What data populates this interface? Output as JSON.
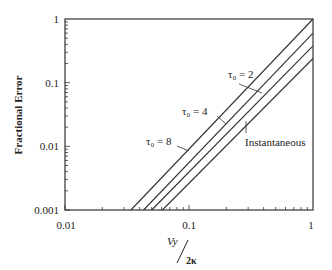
{
  "chart_data": {
    "type": "line",
    "title": "",
    "xlabel": "Vy / 2κ",
    "xlabel_parts": {
      "numerator": "Vy",
      "denominator": "2κ"
    },
    "ylabel": "Fractional Error",
    "xscale": "log",
    "yscale": "log",
    "xlim": [
      0.01,
      1
    ],
    "ylim": [
      0.001,
      1
    ],
    "grid": false,
    "legend": "inline annotations with leader lines",
    "x_ticks": [
      {
        "value": 0.01,
        "label": "0.01"
      },
      {
        "value": 0.1,
        "label": "0.1"
      },
      {
        "value": 1,
        "label": "1"
      }
    ],
    "y_ticks": [
      {
        "value": 1,
        "label": "1"
      },
      {
        "value": 0.1,
        "label": "0.1"
      },
      {
        "value": 0.01,
        "label": "0.01"
      },
      {
        "value": 0.001,
        "label": "0.001"
      }
    ],
    "series": [
      {
        "name": "τ0 = 8",
        "label": "τ₀ = 8",
        "points": [
          [
            0.034,
            0.001
          ],
          [
            1,
            1.0
          ]
        ]
      },
      {
        "name": "τ0 = 4",
        "label": "τ₀ = 4",
        "points": [
          [
            0.043,
            0.001
          ],
          [
            1,
            0.6
          ]
        ]
      },
      {
        "name": "τ0 = 2",
        "label": "τ₀ = 2",
        "points": [
          [
            0.05,
            0.001
          ],
          [
            1,
            0.38
          ]
        ]
      },
      {
        "name": "Instantaneous",
        "label": "Instantaneous",
        "points": [
          [
            0.061,
            0.001
          ],
          [
            1,
            0.24
          ]
        ]
      }
    ]
  },
  "annotations": {
    "tau2": "τ₀ = 2",
    "tau4": "τ₀ = 4",
    "tau8": "τ₀ = 8",
    "instantaneous": "Instantaneous"
  },
  "axes": {
    "ylabel": "Fractional Error",
    "xlabel_num": "Vy",
    "xlabel_den": "2κ",
    "x_tick_labels": [
      "0.01",
      "0.1",
      "1"
    ],
    "y_tick_labels": [
      "1",
      "0.1",
      "0.01",
      "0.001"
    ]
  },
  "colors": {
    "line": "#333333",
    "axis": "#333333",
    "background": "#ffffff"
  }
}
